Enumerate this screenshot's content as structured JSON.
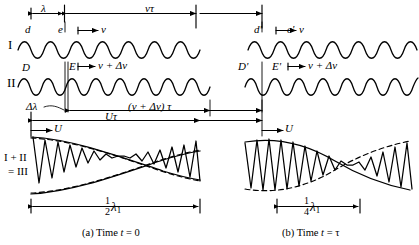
{
  "figure": {
    "row_labels": {
      "row1": "I",
      "row2": "II",
      "row3_line1": "I + II",
      "row3_line2": "= III"
    },
    "panels": [
      {
        "id": "a",
        "caption": "(a) Time t = 0",
        "caption_prefix": "(a)",
        "caption_word": "Time",
        "caption_var": "t",
        "caption_eq": "= 0",
        "wave1_points": [
          "d",
          "e"
        ],
        "wave2_points": [
          "D",
          "E"
        ],
        "wave1_velocity": "v",
        "wave2_velocity": "v + Δv",
        "wavelength_label": "λ",
        "delta_wavelength_label": "Δλ",
        "distance_wave1": "vτ",
        "distance_wave2": "(v + Δv) τ",
        "group_distance": "Uτ",
        "group_velocity": "U",
        "beat_span": "½λ1",
        "beat_span_num": "1",
        "beat_span_den": "2",
        "beat_span_sym": "λ",
        "beat_span_sub": "1"
      },
      {
        "id": "b",
        "caption": "(b) Time t = τ",
        "caption_prefix": "(b)",
        "caption_word": "Time",
        "caption_var": "t",
        "caption_eq": "= τ",
        "wave1_points": [
          "d'",
          "e'"
        ],
        "wave2_points": [
          "D'",
          "E'"
        ],
        "wave1_velocity": "v",
        "wave2_velocity": "v + Δv",
        "group_velocity": "U",
        "beat_span": "¼λ1",
        "beat_span_num": "1",
        "beat_span_den": "4",
        "beat_span_sym": "λ",
        "beat_span_sub": "1"
      }
    ],
    "colors": {
      "ink": "#000000",
      "background": "#ffffff"
    }
  }
}
